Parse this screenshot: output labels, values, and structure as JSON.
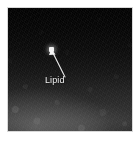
{
  "figure": {
    "kind": "electron-micrograph",
    "background_color": "#ffffff",
    "panel": {
      "border_color": "#d8d8d8",
      "fill_top_color": "#020202",
      "fill_bottom_color": "#333333"
    },
    "annotations": [
      {
        "id": "lipid",
        "label": "Lipid",
        "label_color": "#f2f2f2",
        "arrow_color": "#ededed",
        "arrow_tail": {
          "x": 57,
          "y": 69
        },
        "arrow_head": {
          "x": 44,
          "y": 43
        },
        "target": {
          "x": 43,
          "y": 41,
          "description": "bright lipid particle"
        }
      }
    ]
  }
}
